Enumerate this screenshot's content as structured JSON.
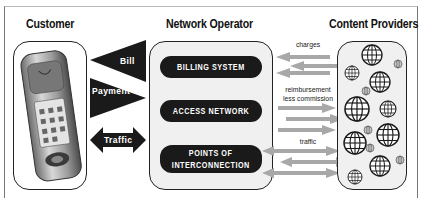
{
  "headings": {
    "customer": "Customer",
    "network_operator": "Network Operator",
    "content_providers": "Content Providers"
  },
  "customer_arrows": {
    "bill": "Bill",
    "payment": "Payment",
    "traffic": "Traffic"
  },
  "operator_components": [
    {
      "label": "BILLING SYSTEM"
    },
    {
      "label": "ACCESS NETWORK"
    },
    {
      "label_line1": "POINTS OF",
      "label_line2": "INTERCONNECTION"
    }
  ],
  "provider_flows": {
    "charges": "charges",
    "reimbursement_line1": "reimbursement",
    "reimbursement_line2": "less commission",
    "traffic": "traffic"
  },
  "colors": {
    "dark": "#1a1a1a",
    "panel": "#f0f0f0",
    "arrow_gray": "#a8a8a8"
  },
  "icons": {
    "customer_device": "mobile-phone-icon",
    "content_provider": "globe-icon"
  }
}
